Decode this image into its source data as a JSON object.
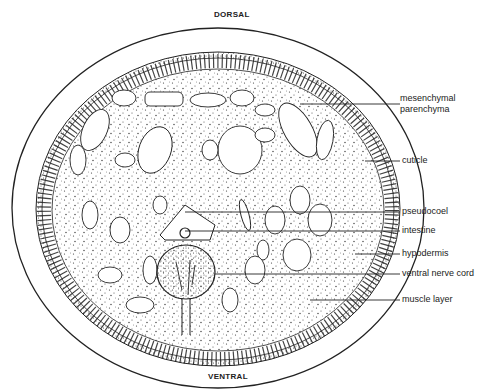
{
  "diagram": {
    "orientation": {
      "top": "DORSAL",
      "bottom": "VENTRAL"
    },
    "labels": [
      {
        "id": "mesenchymal",
        "text": "mesenchymal\nparenchyma",
        "line1": "mesenchymal",
        "line2": "parenchyma"
      },
      {
        "id": "cuticle",
        "text": "cuticle"
      },
      {
        "id": "pseudocoel",
        "text": "pseudocoel"
      },
      {
        "id": "intestine",
        "text": "intestine"
      },
      {
        "id": "hypodermis",
        "text": "hypodermis"
      },
      {
        "id": "ventral_nerve_cord",
        "text": "ventral nerve cord"
      },
      {
        "id": "muscle_layer",
        "text": "muscle layer"
      }
    ],
    "colors": {
      "ink": "#222222",
      "background": "#ffffff"
    }
  }
}
